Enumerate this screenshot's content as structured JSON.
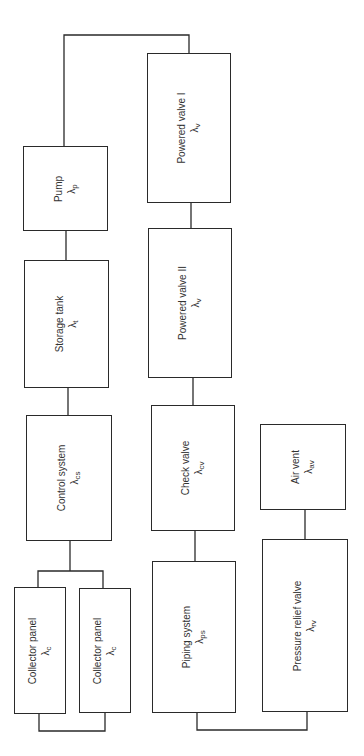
{
  "diagram": {
    "type": "reliability-block-diagram",
    "orientation": "rotated-90-ccw",
    "blocks": [
      {
        "id": "pump",
        "name": "Pump",
        "symbol": "λ",
        "sub": "p"
      },
      {
        "id": "storage-tank",
        "name": "Storage tank",
        "symbol": "λ",
        "sub": "t"
      },
      {
        "id": "control-system",
        "name": "Control system",
        "symbol": "λ",
        "sub": "cs"
      },
      {
        "id": "collector-panel-1",
        "name": "Collector panel",
        "symbol": "λ",
        "sub": "c"
      },
      {
        "id": "collector-panel-2",
        "name": "Collector panel",
        "symbol": "λ",
        "sub": "c"
      },
      {
        "id": "powered-valve-1",
        "name": "Powered valve I",
        "symbol": "λ",
        "sub": "v"
      },
      {
        "id": "powered-valve-2",
        "name": "Powered valve II",
        "symbol": "λ",
        "sub": "v"
      },
      {
        "id": "check-valve",
        "name": "Check valve",
        "symbol": "λ",
        "sub": "cv"
      },
      {
        "id": "piping-system",
        "name": "Piping system",
        "symbol": "λ",
        "sub": "ps"
      },
      {
        "id": "air-vent",
        "name": "Air vent",
        "symbol": "λ",
        "sub": "av"
      },
      {
        "id": "pressure-relief-valve",
        "name": "Pressure relief valve",
        "symbol": "λ",
        "sub": "rv"
      }
    ],
    "connections": [
      [
        "collector-panel-1 || collector-panel-2",
        "control-system"
      ],
      [
        "control-system",
        "storage-tank"
      ],
      [
        "storage-tank",
        "pump"
      ],
      [
        "pump",
        "powered-valve-1"
      ],
      [
        "powered-valve-1",
        "powered-valve-2"
      ],
      [
        "powered-valve-2",
        "check-valve"
      ],
      [
        "check-valve",
        "piping-system"
      ],
      [
        "piping-system",
        "pressure-relief-valve"
      ],
      [
        "pressure-relief-valve",
        "air-vent"
      ]
    ]
  }
}
